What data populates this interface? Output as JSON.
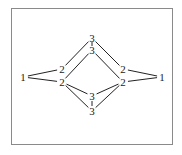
{
  "diagram": {
    "type": "graph",
    "nodes": [
      {
        "id": "L1",
        "label": "1",
        "x": 23,
        "y": 77
      },
      {
        "id": "R1",
        "label": "1",
        "x": 162,
        "y": 77
      },
      {
        "id": "UL2",
        "label": "2",
        "x": 62,
        "y": 69
      },
      {
        "id": "LL2",
        "label": "2",
        "x": 62,
        "y": 82
      },
      {
        "id": "UR2",
        "label": "2",
        "x": 123,
        "y": 69
      },
      {
        "id": "LR2",
        "label": "2",
        "x": 123,
        "y": 82
      },
      {
        "id": "T3a",
        "label": "3",
        "x": 92,
        "y": 38
      },
      {
        "id": "T3b",
        "label": "3",
        "x": 92,
        "y": 50
      },
      {
        "id": "B3c",
        "label": "3",
        "x": 92,
        "y": 96
      },
      {
        "id": "B3d",
        "label": "3",
        "x": 92,
        "y": 111
      }
    ],
    "edges": [
      [
        "L1",
        "UL2"
      ],
      [
        "L1",
        "LL2"
      ],
      [
        "R1",
        "UR2"
      ],
      [
        "R1",
        "LR2"
      ],
      [
        "T3a",
        "T3b"
      ],
      [
        "B3c",
        "B3d"
      ],
      [
        "UL2",
        "T3a"
      ],
      [
        "T3a",
        "UR2"
      ],
      [
        "LL2",
        "T3b"
      ],
      [
        "T3b",
        "LR2"
      ],
      [
        "LL2",
        "B3c"
      ],
      [
        "B3c",
        "LR2"
      ],
      [
        "LL2",
        "B3d"
      ],
      [
        "B3d",
        "LR2"
      ]
    ],
    "colors": {
      "line": "#222222",
      "border": "#8a8a8a"
    }
  }
}
